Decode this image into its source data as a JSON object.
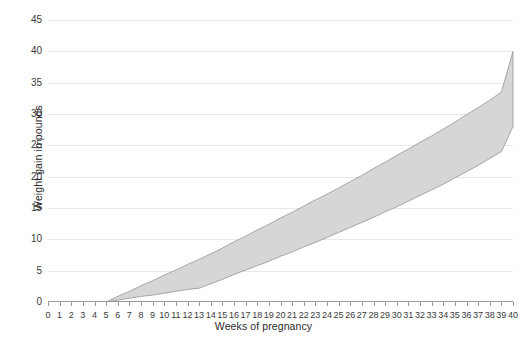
{
  "chart_data": {
    "type": "area",
    "title": "",
    "subtitle": "",
    "xlabel": "Weeks of pregnancy",
    "ylabel": "Weight gain in pounds",
    "xlim": [
      0,
      40
    ],
    "ylim": [
      0,
      45
    ],
    "xtick_step": 1,
    "ytick_step": 5,
    "grid": true,
    "legend": "none",
    "xticks": [
      0,
      1,
      2,
      3,
      4,
      5,
      6,
      7,
      8,
      9,
      10,
      11,
      12,
      13,
      14,
      15,
      16,
      17,
      18,
      19,
      20,
      21,
      22,
      23,
      24,
      25,
      26,
      27,
      28,
      29,
      30,
      31,
      32,
      33,
      34,
      35,
      36,
      37,
      38,
      39,
      40
    ],
    "yticks": [
      0,
      5,
      10,
      15,
      20,
      25,
      30,
      35,
      40,
      45
    ],
    "x": [
      5,
      6,
      7,
      8,
      9,
      10,
      11,
      12,
      13,
      14,
      15,
      16,
      17,
      18,
      19,
      20,
      21,
      22,
      23,
      24,
      25,
      26,
      27,
      28,
      29,
      30,
      31,
      32,
      33,
      34,
      35,
      36,
      37,
      38,
      39,
      40
    ],
    "series": [
      {
        "name": "Upper recommended weight gain",
        "values": [
          0.0,
          0.9,
          1.7,
          2.6,
          3.4,
          4.3,
          5.1,
          6.0,
          6.8,
          7.7,
          8.6,
          9.6,
          10.5,
          11.5,
          12.4,
          13.4,
          14.3,
          15.3,
          16.3,
          17.2,
          18.2,
          19.2,
          20.2,
          21.3,
          22.3,
          23.4,
          24.4,
          25.5,
          26.5,
          27.6,
          28.7,
          29.9,
          31.0,
          32.2,
          33.5,
          40.0
        ]
      },
      {
        "name": "Lower recommended weight gain",
        "values": [
          0.0,
          0.3,
          0.6,
          0.9,
          1.1,
          1.4,
          1.7,
          2.0,
          2.2,
          2.9,
          3.6,
          4.4,
          5.1,
          5.8,
          6.5,
          7.3,
          8.0,
          8.8,
          9.5,
          10.3,
          11.1,
          11.9,
          12.7,
          13.5,
          14.4,
          15.2,
          16.1,
          17.0,
          17.9,
          18.8,
          19.8,
          20.8,
          21.8,
          22.9,
          24.0,
          28.0
        ]
      }
    ],
    "band_fill_color": "#d6d6d6",
    "band_border_color": "#9e9e9e",
    "grid_color": "#e8e8e8",
    "axis_color": "#9a9a9a",
    "text_color": "#3a3a3a",
    "background_color": "#ffffff"
  }
}
